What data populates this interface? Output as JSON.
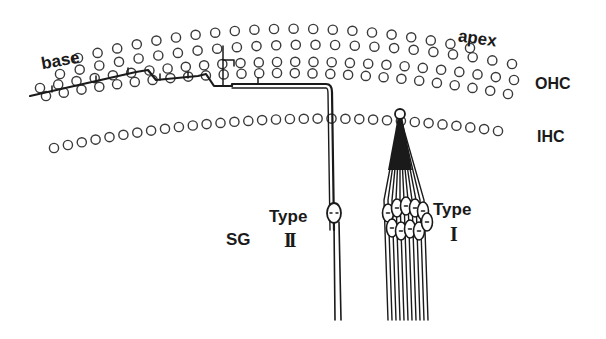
{
  "diagram": {
    "labels": {
      "base": "base",
      "apex": "apex",
      "ohc": "OHC",
      "ihc": "IHC",
      "sg": "SG",
      "type_word_left": "Type",
      "type_numeral_left": "II",
      "type_word_right": "Type",
      "type_numeral_right": "I"
    },
    "colors": {
      "ink": "#1a1a1a",
      "circle_stroke": "#3a3a3a",
      "background": "#ffffff"
    },
    "rows": {
      "ohc_row1": {
        "x0": 60,
        "y0": 74,
        "x1": 512,
        "y1": 64,
        "sag": -24,
        "count": 24
      },
      "ohc_row2": {
        "x0": 40,
        "y0": 88,
        "x1": 514,
        "y1": 80,
        "sag": -22,
        "count": 27
      },
      "ohc_row3": {
        "x0": 46,
        "y0": 96,
        "x1": 508,
        "y1": 94,
        "sag": -22,
        "count": 27
      },
      "ohc_row0": {
        "x0": 78,
        "y0": 58,
        "x1": 470,
        "y1": 48,
        "sag": -24,
        "count": 21
      },
      "ihc_row": {
        "x0": 54,
        "y0": 148,
        "x1": 498,
        "y1": 131,
        "sag": -20,
        "count": 33
      }
    }
  }
}
